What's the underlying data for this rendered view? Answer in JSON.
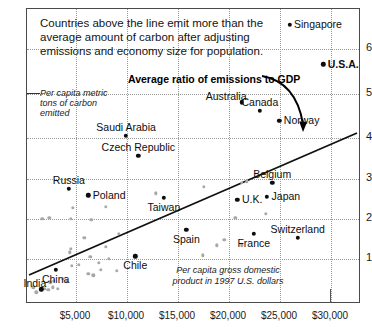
{
  "chart_data": {
    "type": "scatter",
    "title": "",
    "headnote": [
      "Countries above the line emit more than the",
      "average amount of carbon after adjusting",
      "emissions and economy size for population."
    ],
    "xlabel": "Per capita gross domestic product in 1997 U.S. dollars",
    "xlabel_lines": [
      "Per capita gross domestic",
      "product in 1997 U.S. dollars"
    ],
    "ylabel": "Per capita metric tons of carbon emitted",
    "ylabel_lines": [
      "Per capita metric",
      "tons of carbon",
      "emitted"
    ],
    "annotation": "Average ratio of emissions to GDP",
    "xlim": [
      0,
      32500
    ],
    "ylim": [
      0,
      6.6
    ],
    "xticks": [
      5000,
      10000,
      15000,
      20000,
      25000,
      30000
    ],
    "xticklabels": [
      "$5,000",
      "$10,000",
      "$15,000",
      "$20,000",
      "$25,000",
      "$30,000"
    ],
    "yticks": [
      1,
      2,
      3,
      4,
      5,
      6
    ],
    "yticklabels": [
      "1",
      "2",
      "3",
      "4",
      "5",
      "6"
    ],
    "grid": true,
    "legend": "none",
    "trendline": {
      "label": "Average ratio of emissions to GDP",
      "x0": 200,
      "y0": 0.55,
      "x1": 32200,
      "y1": 4.15
    },
    "labeled_points": [
      {
        "name": "Singapore",
        "x": 25700,
        "y": 6.25,
        "label_side": "right",
        "bold": false
      },
      {
        "name": "U.S.A.",
        "x": 29000,
        "y": 5.35,
        "label_side": "right",
        "bold": true
      },
      {
        "name": "Australia",
        "x": 21000,
        "y": 4.5,
        "label_side": "left",
        "bold": false
      },
      {
        "name": "Canada",
        "x": 22800,
        "y": 4.3,
        "label_side": "above",
        "bold": false
      },
      {
        "name": "Norway",
        "x": 24700,
        "y": 4.08,
        "label_side": "right",
        "bold": false
      },
      {
        "name": "Saudi Arabia",
        "x": 9700,
        "y": 3.75,
        "label_side": "above",
        "bold": false
      },
      {
        "name": "Czech Republic",
        "x": 10900,
        "y": 3.3,
        "label_side": "above",
        "bold": false
      },
      {
        "name": "Russia",
        "x": 4100,
        "y": 2.55,
        "label_side": "above",
        "bold": false
      },
      {
        "name": "Belgium",
        "x": 24000,
        "y": 2.68,
        "label_side": "above",
        "bold": false
      },
      {
        "name": "Poland",
        "x": 6000,
        "y": 2.4,
        "label_side": "right",
        "bold": false
      },
      {
        "name": "Taiwan",
        "x": 13400,
        "y": 2.35,
        "label_side": "below",
        "bold": false
      },
      {
        "name": "Japan",
        "x": 23500,
        "y": 2.37,
        "label_side": "right",
        "bold": false
      },
      {
        "name": "U.K.",
        "x": 20600,
        "y": 2.3,
        "label_side": "right",
        "bold": false
      },
      {
        "name": "Spain",
        "x": 15600,
        "y": 1.62,
        "label_side": "below",
        "bold": false
      },
      {
        "name": "France",
        "x": 22200,
        "y": 1.53,
        "label_side": "below",
        "bold": false
      },
      {
        "name": "Switzerland",
        "x": 26500,
        "y": 1.45,
        "label_side": "above",
        "bold": false
      },
      {
        "name": "Chile",
        "x": 10600,
        "y": 1.03,
        "label_side": "below",
        "bold": false
      },
      {
        "name": "China",
        "x": 2800,
        "y": 0.72,
        "label_side": "below",
        "bold": false
      },
      {
        "name": "India",
        "x": 1400,
        "y": 0.29,
        "label_side": "left",
        "bold": false
      }
    ],
    "unlabeled_points": [
      {
        "x": 600,
        "y": 0.33
      },
      {
        "x": 900,
        "y": 0.22
      },
      {
        "x": 1700,
        "y": 0.3
      },
      {
        "x": 2100,
        "y": 0.27
      },
      {
        "x": 2300,
        "y": 0.44
      },
      {
        "x": 2500,
        "y": 0.33
      },
      {
        "x": 2650,
        "y": 0.48
      },
      {
        "x": 3000,
        "y": 0.3
      },
      {
        "x": 3500,
        "y": 0.52
      },
      {
        "x": 3900,
        "y": 0.47
      },
      {
        "x": 4400,
        "y": 0.82
      },
      {
        "x": 5100,
        "y": 0.84
      },
      {
        "x": 4200,
        "y": 1.12
      },
      {
        "x": 4300,
        "y": 1.2
      },
      {
        "x": 5600,
        "y": 1.44
      },
      {
        "x": 6200,
        "y": 1.02
      },
      {
        "x": 7000,
        "y": 0.88
      },
      {
        "x": 6000,
        "y": 0.64
      },
      {
        "x": 6500,
        "y": 0.6
      },
      {
        "x": 8000,
        "y": 0.97
      },
      {
        "x": 7200,
        "y": 0.72
      },
      {
        "x": 8800,
        "y": 0.7
      },
      {
        "x": 7700,
        "y": 1.25
      },
      {
        "x": 9000,
        "y": 1.53
      },
      {
        "x": 4500,
        "y": 2.12
      },
      {
        "x": 7700,
        "y": 2.14
      },
      {
        "x": 4300,
        "y": 1.87
      },
      {
        "x": 2200,
        "y": 1.9
      },
      {
        "x": 1500,
        "y": 1.88
      },
      {
        "x": 6300,
        "y": 1.85
      },
      {
        "x": 12600,
        "y": 2.45
      },
      {
        "x": 17300,
        "y": 2.6
      },
      {
        "x": 21000,
        "y": 2.68
      },
      {
        "x": 21500,
        "y": 2.72
      },
      {
        "x": 20400,
        "y": 1.9
      },
      {
        "x": 23400,
        "y": 1.98
      },
      {
        "x": 19300,
        "y": 1.4
      },
      {
        "x": 21000,
        "y": 1.28
      },
      {
        "x": 18600,
        "y": 1.28
      },
      {
        "x": 17200,
        "y": 1.05
      }
    ]
  }
}
